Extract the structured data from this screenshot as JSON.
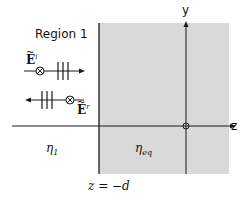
{
  "figure": {
    "region_label": "Region 1",
    "incident_field": {
      "symbol": "E",
      "tilde": "~",
      "superscript": "i",
      "direction": "+z"
    },
    "reflected_field": {
      "symbol": "E",
      "tilde": "~",
      "superscript": "r",
      "direction": "-z"
    },
    "medium_left": {
      "symbol": "η",
      "subscript": "1"
    },
    "medium_right": {
      "symbol": "η",
      "subscript": "eq"
    },
    "boundary_label": "z = −d",
    "axes": {
      "vertical": "y",
      "horizontal": "z"
    },
    "colors": {
      "shaded_region": "#d9d9d9",
      "lines": "#1a1a1a",
      "background": "#ffffff"
    }
  }
}
